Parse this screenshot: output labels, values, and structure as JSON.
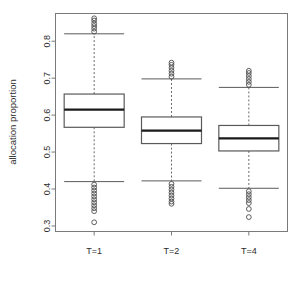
{
  "chart_data": {
    "type": "box",
    "title": "",
    "xlabel": "",
    "ylabel": "allocation proportion",
    "categories": [
      "T=1",
      "T=2",
      "T=4"
    ],
    "ylim": [
      0.285,
      0.875
    ],
    "yticks": [
      0.3,
      0.4,
      0.5,
      0.6,
      0.7,
      0.8
    ],
    "ytick_labels": [
      "0.3",
      "0.4",
      "0.5",
      "0.6",
      "0.7",
      "0.8"
    ],
    "grid": false,
    "legend": "none",
    "boxes": [
      {
        "name": "T=1",
        "q1": 0.567,
        "median": 0.615,
        "q3": 0.657,
        "whisker_low": 0.42,
        "whisker_high": 0.82,
        "outliers_high": [
          0.826,
          0.834,
          0.841,
          0.848,
          0.856,
          0.862
        ],
        "outliers_low": [
          0.412,
          0.404,
          0.396,
          0.388,
          0.38,
          0.372,
          0.364,
          0.356,
          0.348,
          0.34,
          0.31
        ]
      },
      {
        "name": "T=2",
        "q1": 0.523,
        "median": 0.558,
        "q3": 0.595,
        "whisker_low": 0.422,
        "whisker_high": 0.698,
        "outliers_high": [
          0.704,
          0.712,
          0.72,
          0.728,
          0.736,
          0.742
        ],
        "outliers_low": [
          0.414,
          0.406,
          0.398,
          0.39,
          0.382,
          0.374,
          0.366,
          0.36
        ]
      },
      {
        "name": "T=4",
        "q1": 0.503,
        "median": 0.537,
        "q3": 0.572,
        "whisker_low": 0.402,
        "whisker_high": 0.675,
        "outliers_high": [
          0.682,
          0.69,
          0.698,
          0.706,
          0.714,
          0.72
        ],
        "outliers_low": [
          0.394,
          0.386,
          0.378,
          0.37,
          0.362,
          0.346,
          0.324
        ]
      }
    ],
    "colors": {
      "box_border": "#5a5a5a",
      "median": "#1a1a1a",
      "whisker": "#6a6a6a",
      "outlier": "#4d4d4d",
      "frame": "#7a7a7a",
      "text": "#2b2b2b",
      "background": "#ffffff"
    }
  }
}
